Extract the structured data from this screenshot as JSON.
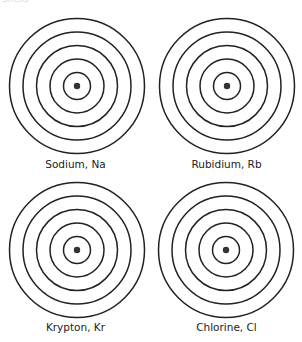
{
  "figure": {
    "caption_fragment": "Shells",
    "stroke_color": "#222222",
    "nucleus_color": "#333333",
    "shell_radii": [
      13.5,
      27,
      40.5,
      54,
      67.5
    ],
    "atoms": [
      {
        "label": "Sodium, Na",
        "element": "Sodium",
        "symbol": "Na",
        "shells": 5
      },
      {
        "label": "Rubidium, Rb",
        "element": "Rubidium",
        "symbol": "Rb",
        "shells": 5
      },
      {
        "label": "Krypton, Kr",
        "element": "Krypton",
        "symbol": "Kr",
        "shells": 5
      },
      {
        "label": "Chlorine, Cl",
        "element": "Chlorine",
        "symbol": "Cl",
        "shells": 5
      }
    ]
  }
}
